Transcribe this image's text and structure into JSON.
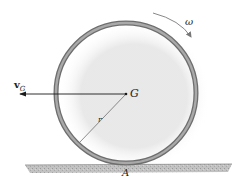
{
  "figure": {
    "labels": {
      "velocity_symbol": "v",
      "velocity_subscript": "G",
      "center": "G",
      "radius": "r",
      "angular_velocity": "ω",
      "contact_point": "A"
    },
    "colors": {
      "ring_outer": "#6e6e6e",
      "ring_inner": "#a9a9a9",
      "ground": "#b9b9b9",
      "line": "#1a1a1a",
      "text": "#222222"
    }
  }
}
